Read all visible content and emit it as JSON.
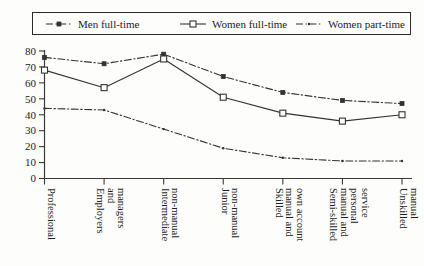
{
  "chart_data": {
    "type": "line",
    "title": "",
    "xlabel": "",
    "ylabel": "",
    "ylim": [
      0,
      80
    ],
    "ytick_step": 10,
    "yticks": [
      "0",
      "10",
      "20",
      "30",
      "40",
      "50",
      "60",
      "70",
      "80"
    ],
    "grid": false,
    "legend_position": "top",
    "categories": [
      "Professional",
      "Employers and managers",
      "Intermediate non-manual",
      "Junior non-manual",
      "Skilled manual and own account",
      "Semi-skilled manual and personal service",
      "Unskilled manual"
    ],
    "category_lines": [
      [
        "Professional"
      ],
      [
        "Employers",
        "and",
        "managers"
      ],
      [
        "Intermediate",
        "non-manual"
      ],
      [
        "Junior",
        "non-manual"
      ],
      [
        "Skilled",
        "manual and",
        "own account"
      ],
      [
        "Semi-skilled",
        "manual and",
        "personal",
        "service"
      ],
      [
        "Unskilled",
        "manual"
      ]
    ],
    "series": [
      {
        "name": "Men full-time",
        "style": "dash-dot",
        "marker": "filled-square",
        "color": "#333333",
        "values": [
          76,
          72,
          78,
          64,
          54,
          49,
          47
        ]
      },
      {
        "name": "Women full-time",
        "style": "solid",
        "marker": "open-square",
        "color": "#333333",
        "values": [
          68,
          57,
          75,
          51,
          41,
          36,
          40
        ]
      },
      {
        "name": "Women part-time",
        "style": "dash-dot",
        "marker": "dot",
        "color": "#333333",
        "values": [
          44,
          43,
          31,
          19,
          13,
          11,
          11
        ]
      }
    ]
  },
  "legend": {
    "items": [
      {
        "label": "Men full-time"
      },
      {
        "label": "Women full-time"
      },
      {
        "label": "Women part-time"
      }
    ]
  }
}
